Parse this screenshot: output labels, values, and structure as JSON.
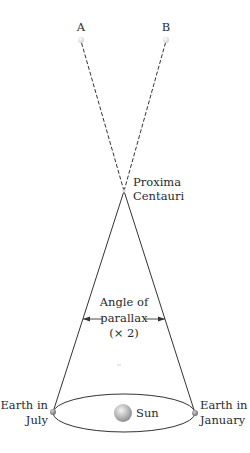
{
  "figure": {
    "type": "parallax-diagram",
    "labels": {
      "star_a": "A",
      "star_b": "B",
      "proxima_line1": "Proxima",
      "proxima_line2": "Centauri",
      "angle_line1": "Angle of",
      "angle_line2": "parallax",
      "angle_line3": "(× 2)",
      "earth_july_line1": "Earth in",
      "earth_july_line2": "July",
      "earth_jan_line1": "Earth in",
      "earth_jan_line2": "January",
      "sun": "Sun"
    },
    "colors": {
      "line": "#333333",
      "star_dot": "#e6e6e6",
      "sun": "#b5b5b5",
      "earth": "#8a8a8a",
      "text": "#2a2a2a"
    }
  }
}
